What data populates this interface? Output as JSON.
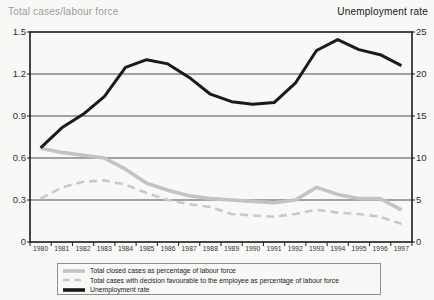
{
  "header": {
    "left_title": "Total cases/labour force",
    "right_title": "Unemployment rate"
  },
  "colors": {
    "border": "#1a1a1a",
    "gridline": "#4d4d4d",
    "background": "#f8f8f6",
    "left_title": "#9b9b9b",
    "right_title": "#151515",
    "legend_border": "#8f8f8f"
  },
  "chart_data": {
    "type": "line",
    "title": "",
    "left_axis": {
      "label": "Total cases/labour force",
      "range": [
        0,
        1.5
      ],
      "ticks": [
        "1.5",
        "1.2",
        "0.9",
        "0.6",
        "0.3",
        "0"
      ]
    },
    "right_axis": {
      "label": "Unemployment rate",
      "range": [
        0,
        25
      ],
      "ticks": [
        "25",
        "20",
        "15",
        "10",
        "5",
        "0"
      ]
    },
    "grid": "horizontal",
    "legend_position": "bottom",
    "categories": [
      "1980",
      "1981",
      "1982",
      "1983",
      "1984",
      "1985",
      "1986",
      "1987",
      "1988",
      "1989",
      "1990",
      "1991",
      "1992",
      "1993",
      "1994",
      "1995",
      "1996",
      "1997"
    ],
    "series": [
      {
        "name": "Total closed cases as percentage of labour force",
        "axis": "left",
        "color": "#c3c3c3",
        "style": "solid",
        "width": 3.6,
        "values": [
          0.67,
          0.64,
          0.62,
          0.6,
          0.52,
          0.42,
          0.37,
          0.33,
          0.31,
          0.3,
          0.29,
          0.28,
          0.3,
          0.39,
          0.34,
          0.31,
          0.31,
          0.23
        ]
      },
      {
        "name": "Total cases with decision favourable to the employee as percentage of labour force",
        "axis": "left",
        "color": "#c9c9c9",
        "style": "dashed",
        "width": 2.6,
        "values": [
          0.31,
          0.39,
          0.43,
          0.44,
          0.41,
          0.35,
          0.3,
          0.27,
          0.25,
          0.2,
          0.19,
          0.18,
          0.2,
          0.23,
          0.21,
          0.2,
          0.18,
          0.13
        ]
      },
      {
        "name": "Unemployment rate",
        "axis": "right",
        "color": "#1a1a1a",
        "style": "solid",
        "width": 3.0,
        "values": [
          11.2,
          13.6,
          15.2,
          17.3,
          20.8,
          21.7,
          21.2,
          19.6,
          17.6,
          16.7,
          16.4,
          16.6,
          18.9,
          22.8,
          24.1,
          22.9,
          22.3,
          21.0
        ]
      }
    ]
  }
}
